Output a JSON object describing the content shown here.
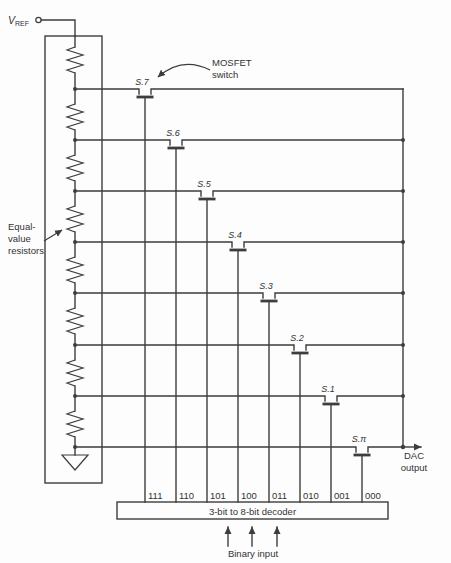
{
  "colors": {
    "ink": "#3d3d3d",
    "background": "#fdfdfd"
  },
  "vref": {
    "main": "V",
    "sub": "REF"
  },
  "annotations": {
    "mosfet_switch": {
      "line1": "MOSFET",
      "line2": "switch"
    },
    "equal_resistors": {
      "line1": "Equal-",
      "line2": "value",
      "line3": "resistors"
    }
  },
  "dac_output": {
    "line1": "DAC",
    "line2": "output"
  },
  "decoder": {
    "label": "3-bit to 8-bit decoder"
  },
  "binary_input": {
    "label": "Binary input"
  },
  "switches": [
    {
      "label": "S.7",
      "code": "111"
    },
    {
      "label": "S.6",
      "code": "110"
    },
    {
      "label": "S.5",
      "code": "101"
    },
    {
      "label": "S.4",
      "code": "100"
    },
    {
      "label": "S.3",
      "code": "011"
    },
    {
      "label": "S.2",
      "code": "010"
    },
    {
      "label": "S.1",
      "code": "001"
    },
    {
      "label": "S.π",
      "code": "000"
    }
  ]
}
